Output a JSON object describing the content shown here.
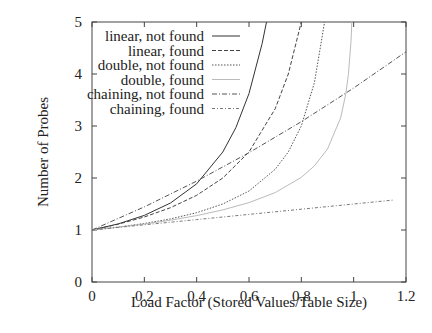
{
  "chart_data": {
    "type": "line",
    "title": "",
    "xlabel": "Load Factor (Stored Values/Table Size)",
    "ylabel": "Number of Probes",
    "xlim": [
      0,
      1.2
    ],
    "ylim": [
      0,
      5
    ],
    "xticks": [
      "0",
      "0.2",
      "0.4",
      "0.6",
      "0.8",
      "1",
      "1.2"
    ],
    "yticks": [
      "0",
      "1",
      "2",
      "3",
      "4",
      "5"
    ],
    "grid": false,
    "legend_position": "top-left inside",
    "series": [
      {
        "name": "linear, not found",
        "style": "solid",
        "color": "#333333",
        "x": [
          0,
          0.1,
          0.2,
          0.3,
          0.4,
          0.5,
          0.55,
          0.6,
          0.65,
          0.667
        ],
        "y": [
          1,
          1.117,
          1.281,
          1.52,
          1.889,
          2.5,
          2.969,
          3.625,
          4.582,
          5.0
        ]
      },
      {
        "name": "linear, found",
        "style": "dashed",
        "color": "#444444",
        "x": [
          0,
          0.1,
          0.2,
          0.3,
          0.4,
          0.5,
          0.6,
          0.7,
          0.75,
          0.8
        ],
        "y": [
          1,
          1.111,
          1.25,
          1.429,
          1.667,
          2.0,
          2.5,
          3.333,
          4.0,
          5.0
        ]
      },
      {
        "name": "double, not found",
        "style": "dotted",
        "color": "#555555",
        "x": [
          0,
          0.1,
          0.2,
          0.3,
          0.4,
          0.5,
          0.6,
          0.7,
          0.75,
          0.8,
          0.85,
          0.889
        ],
        "y": [
          1,
          1.056,
          1.125,
          1.214,
          1.333,
          1.5,
          1.75,
          2.167,
          2.5,
          3.0,
          3.833,
          5.0
        ]
      },
      {
        "name": "double, found",
        "style": "solid-light",
        "color": "#bbbbbb",
        "x": [
          0,
          0.1,
          0.2,
          0.3,
          0.4,
          0.5,
          0.6,
          0.7,
          0.8,
          0.85,
          0.9,
          0.95,
          0.97,
          0.98,
          0.99,
          0.993
        ],
        "y": [
          1,
          1.054,
          1.116,
          1.189,
          1.277,
          1.386,
          1.527,
          1.72,
          2.012,
          2.232,
          2.558,
          3.153,
          3.615,
          3.992,
          4.652,
          5.0
        ]
      },
      {
        "name": "chaining, not found",
        "style": "dash-dot",
        "color": "#555555",
        "x": [
          0,
          0.2,
          0.4,
          0.6,
          0.8,
          1.0,
          1.2
        ],
        "y": [
          1,
          1.445,
          1.941,
          2.487,
          3.083,
          3.73,
          4.427
        ]
      },
      {
        "name": "chaining, found",
        "style": "dash-dot-fine",
        "color": "#777777",
        "x": [
          0,
          0.4,
          0.8,
          1.15
        ],
        "y": [
          1,
          1.2,
          1.4,
          1.575
        ]
      }
    ]
  }
}
